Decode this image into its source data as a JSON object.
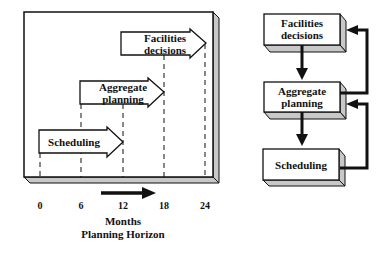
{
  "left_diagram": {
    "arrows": [
      {
        "label_line1": "Scheduling",
        "label_line2": "",
        "start_month": 0,
        "end_month": 12
      },
      {
        "label_line1": "Aggregate",
        "label_line2": "planning",
        "start_month": 6,
        "end_month": 18
      },
      {
        "label_line1": "Facilities",
        "label_line2": "decisions",
        "start_month": 12,
        "end_month": 24
      }
    ],
    "axis": {
      "ticks": [
        "0",
        "6",
        "12",
        "18",
        "24"
      ],
      "unit_label": "Months",
      "title": "Planning Horizon"
    }
  },
  "right_diagram": {
    "boxes": [
      {
        "line1": "Facilities",
        "line2": "decisions"
      },
      {
        "line1": "Aggregate",
        "line2": "planning"
      },
      {
        "line1": "Scheduling",
        "line2": ""
      }
    ]
  },
  "colors": {
    "line": "#111111",
    "box_side": "#c8c8c8",
    "background": "#ffffff"
  }
}
